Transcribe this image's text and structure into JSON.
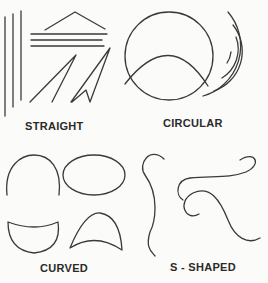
{
  "diagram": {
    "type": "line-type illustration",
    "stroke_color": "#3a3a3a",
    "background": "#fbfbf9",
    "panels": [
      {
        "id": "straight",
        "label": "STRAIGHT"
      },
      {
        "id": "circular",
        "label": "CIRCULAR"
      },
      {
        "id": "curved",
        "label": "CURVED"
      },
      {
        "id": "s-shaped",
        "label": "S - SHAPED"
      }
    ]
  }
}
